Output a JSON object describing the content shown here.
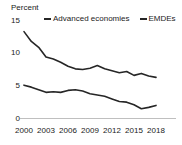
{
  "chart_data": {
    "type": "line",
    "title": "",
    "ylabel": "Percent",
    "xlabel": "",
    "ylim": [
      0,
      15
    ],
    "yticks": [
      0,
      5,
      10,
      15
    ],
    "xlim": [
      2000,
      2018
    ],
    "xticks": [
      2000,
      2003,
      2006,
      2009,
      2012,
      2015,
      2018
    ],
    "xtick_labels": [
      "2000",
      "2003",
      "2006",
      "2009",
      "2012",
      "2015",
      "2018"
    ],
    "ytick_labels": [
      "0",
      "5",
      "10",
      "15"
    ],
    "grid": false,
    "legend_position": "top",
    "x": [
      2000,
      2001,
      2002,
      2003,
      2004,
      2005,
      2006,
      2007,
      2008,
      2009,
      2010,
      2011,
      2012,
      2013,
      2014,
      2015,
      2016,
      2017,
      2018
    ],
    "series": [
      {
        "name": "EMDEs",
        "color": "#262626",
        "values": [
          13.3,
          11.8,
          10.9,
          9.4,
          9.1,
          8.6,
          8.0,
          7.6,
          7.5,
          7.7,
          8.1,
          7.6,
          7.3,
          7.0,
          7.2,
          6.6,
          6.9,
          6.5,
          6.3
        ]
      },
      {
        "name": "Advanced economies",
        "color": "#262626",
        "values": [
          5.1,
          4.8,
          4.4,
          4.0,
          4.1,
          4.0,
          4.3,
          4.4,
          4.2,
          3.8,
          3.6,
          3.4,
          3.0,
          2.6,
          2.5,
          2.1,
          1.5,
          1.7,
          2.0
        ]
      }
    ],
    "legend": [
      "Advanced economies",
      "EMDEs"
    ]
  },
  "legend": {
    "items": [
      {
        "label": "Advanced economies"
      },
      {
        "label": "EMDEs"
      }
    ]
  }
}
